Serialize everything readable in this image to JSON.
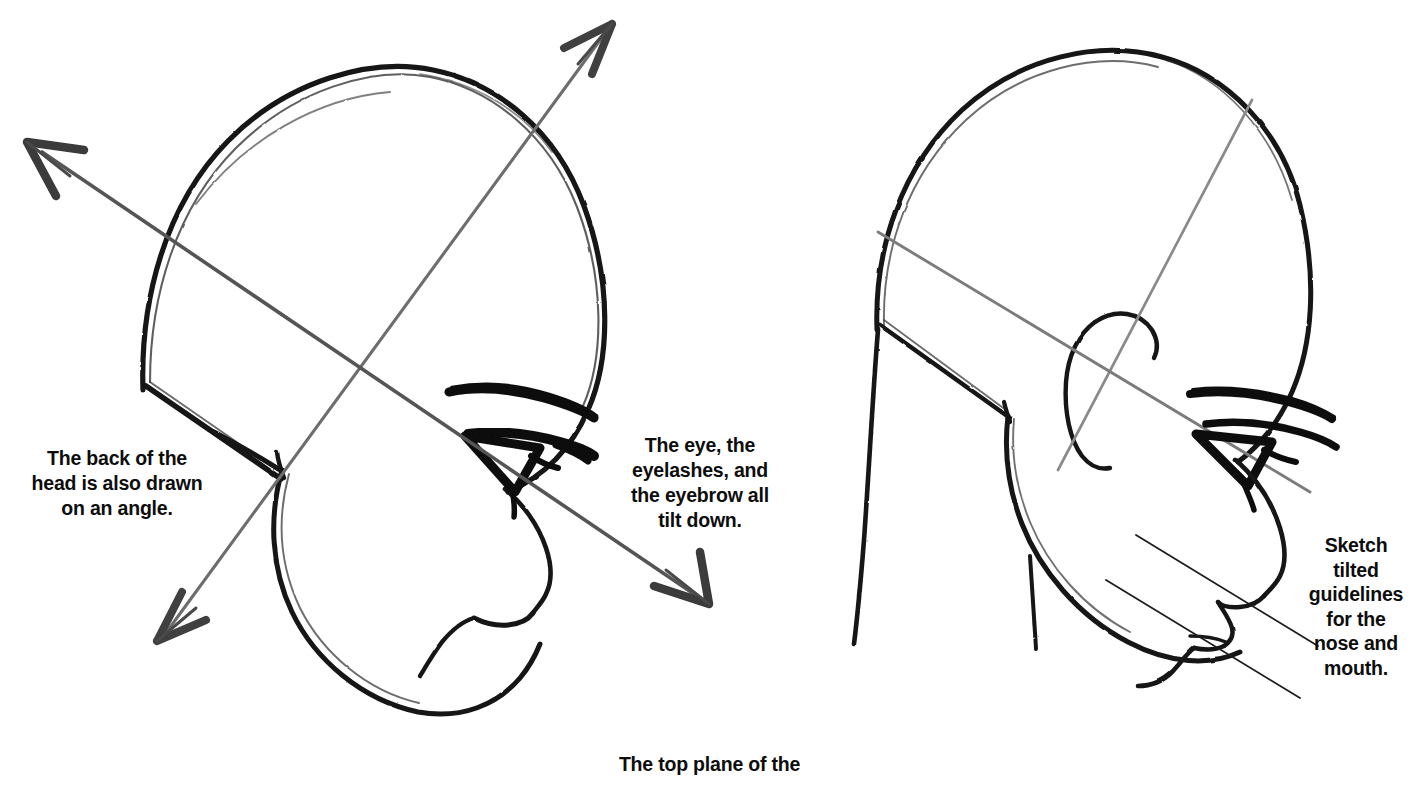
{
  "page": {
    "background_color": "#ffffff",
    "ink_color": "#111111",
    "guideline_color": "#6e6e6e",
    "width": 1418,
    "height": 787
  },
  "captions": {
    "back_of_head": "The back of the\nhead is also drawn\non an angle.",
    "eye_tilt": "The eye, the\neyelashes, and\nthe eyebrow all\ntilt down.",
    "sketch_guidelines": "Sketch\ntilted\nguidelines\nfor the\nnose and\nmouth.",
    "top_plane": "The top plane of the"
  },
  "figures": [
    {
      "id": "left-head",
      "name": "head-with-tilt-axis-arrows",
      "description": "Three-quarter view head outline with two crossing double-headed arrows marking the tilted vertical and horizontal axes",
      "parts": [
        "cranium-outline",
        "jaw-outline",
        "back-of-head-angle-line",
        "eyebrow",
        "eye",
        "eyelash",
        "nose-profile",
        "chin",
        "axis-arrow-vertical",
        "axis-arrow-horizontal"
      ]
    },
    {
      "id": "right-head",
      "name": "head-with-feature-guidelines",
      "description": "Same head with ear, crossing construction guidelines and two thin tilted lines marking nose and mouth placement",
      "parts": [
        "cranium-outline",
        "jaw-outline",
        "neck",
        "ear",
        "guideline-vertical",
        "guideline-horizontal",
        "eyebrow",
        "eye",
        "eyelash",
        "nose-profile",
        "lips",
        "chin",
        "nose-guideline",
        "mouth-guideline"
      ]
    }
  ]
}
